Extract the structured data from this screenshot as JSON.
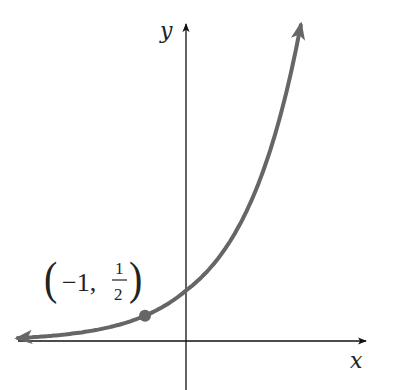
{
  "chart_data": {
    "type": "line",
    "title": "",
    "function": "y = 2^x",
    "xlabel": "x",
    "ylabel": "y",
    "grid": false,
    "series": [
      {
        "name": "exponential curve",
        "color": "#666666",
        "x": [
          -4.1,
          -3,
          -2,
          -1,
          0,
          1,
          2,
          2.8
        ],
        "y": [
          0.06,
          0.125,
          0.25,
          0.5,
          1,
          2,
          4,
          6.96
        ]
      }
    ],
    "highlighted_points": [
      {
        "x": -1,
        "y": 0.5,
        "label_lparen": "(",
        "label_x": "−1,",
        "label_num": "1",
        "label_den": "2",
        "label_rparen": ")"
      }
    ],
    "arrows": {
      "left_end": true,
      "right_end": true
    }
  }
}
